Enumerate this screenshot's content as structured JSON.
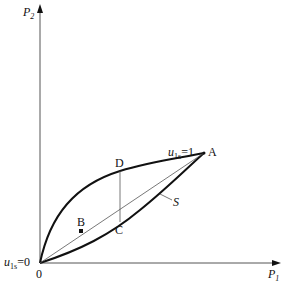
{
  "diagram": {
    "axes": {
      "x_label": "P",
      "x_sub": "1",
      "y_label": "P",
      "y_sub": "2",
      "origin_label": "0"
    },
    "points": {
      "A": "A",
      "B": "B",
      "C": "C",
      "D": "D"
    },
    "curve_label": "S",
    "annotations": {
      "top": {
        "var": "u",
        "sub": "1s",
        "value": "=1"
      },
      "bottom": {
        "var": "u",
        "sub": "1s",
        "value": "=0"
      }
    },
    "colors": {
      "line": "#111111",
      "thin_line": "#555555"
    }
  }
}
